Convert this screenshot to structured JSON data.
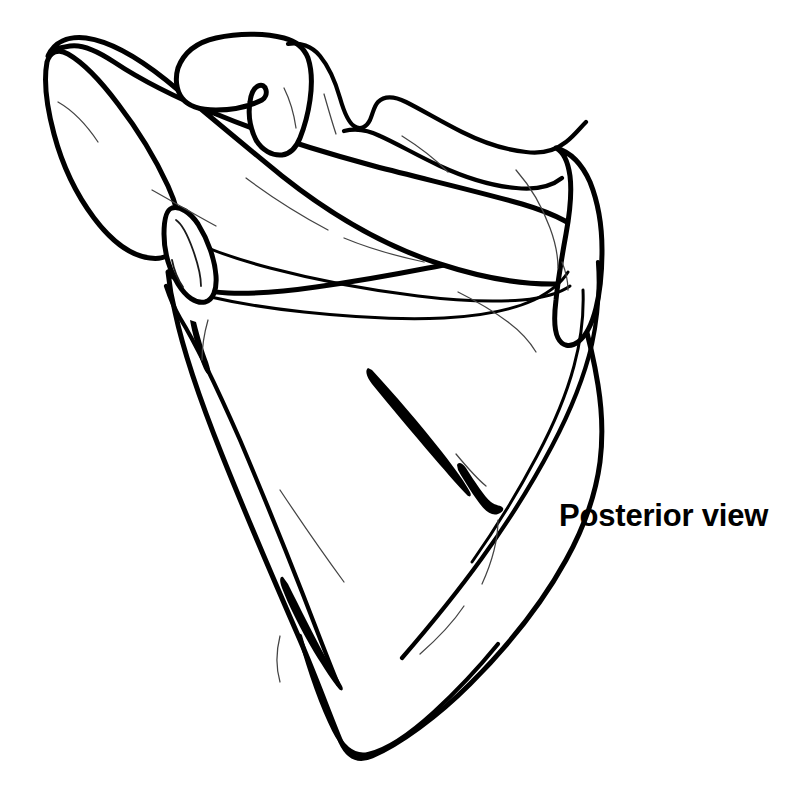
{
  "figure": {
    "view_label": "Posterior view",
    "background_color": "#ffffff",
    "ink_color": "#000000",
    "style": "line-drawing",
    "canvas": {
      "width": 806,
      "height": 803
    }
  },
  "label": {
    "text": "Posterior view",
    "x": 559,
    "y": 500,
    "font_size_px": 31,
    "weight": "bold",
    "color": "#000000"
  },
  "anatomy": {
    "parts": [
      {
        "name": "acromion",
        "label": "Acromion"
      },
      {
        "name": "coracoid-process",
        "label": "Coracoid process"
      },
      {
        "name": "suprascapular-notch",
        "label": "Suprascapular notch"
      },
      {
        "name": "superior-angle",
        "label": "Superior angle"
      },
      {
        "name": "spine-of-scapula",
        "label": "Spine of scapula"
      },
      {
        "name": "supraspinous-fossa",
        "label": "Supraspinous fossa"
      },
      {
        "name": "infraspinous-fossa",
        "label": "Infraspinous fossa"
      },
      {
        "name": "glenoid-cavity",
        "label": "Glenoid cavity"
      },
      {
        "name": "infraglenoid-tubercle",
        "label": "Infraglenoid tubercle"
      },
      {
        "name": "lateral-border",
        "label": "Lateral border"
      },
      {
        "name": "medial-border",
        "label": "Medial border"
      },
      {
        "name": "inferior-angle",
        "label": "Inferior angle"
      }
    ]
  }
}
